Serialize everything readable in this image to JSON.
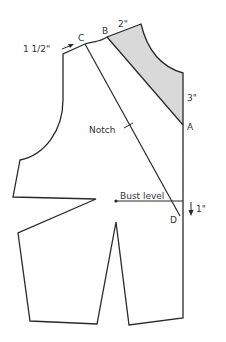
{
  "diagram": {
    "labels": {
      "point_b": "B",
      "point_c": "C",
      "point_a": "A",
      "point_d": "D",
      "shoulder_measure": "2\"",
      "neck_measure": "1 1/2\"",
      "side_measure": "3\"",
      "notch": "Notch",
      "bust_level": "Bust level",
      "drop_measure": "1\""
    },
    "colors": {
      "line": "#2a2a2a",
      "shaded": "#d9d9d9",
      "text": "#333333"
    }
  }
}
